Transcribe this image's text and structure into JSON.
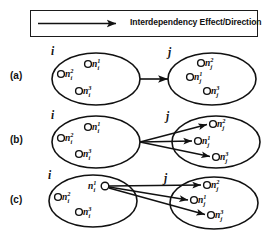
{
  "figure": {
    "background_color": "#ffffff",
    "ink_color": "#111111",
    "legend": {
      "label": "Interdependency Effect/Direction",
      "arrow_icon": "right-arrow-icon"
    },
    "rows": [
      {
        "id": "a",
        "label": "(a)",
        "description": "Whole-set to whole-set interdependency: one arrow from set i to set j",
        "source_set": {
          "label": "i",
          "nodes": [
            {
              "name": "n",
              "superscript": "2",
              "subscript": "i",
              "circle_side": "left"
            },
            {
              "name": "n",
              "superscript": "1",
              "subscript": "i",
              "circle_side": "left"
            },
            {
              "name": "n",
              "superscript": "3",
              "subscript": "i",
              "circle_side": "left"
            }
          ]
        },
        "target_set": {
          "label": "j",
          "nodes": [
            {
              "name": "n",
              "superscript": "2",
              "subscript": "j",
              "circle_side": "left"
            },
            {
              "name": "n",
              "superscript": "1",
              "subscript": "j",
              "circle_side": "left"
            },
            {
              "name": "n",
              "superscript": "3",
              "subscript": "j",
              "circle_side": "left"
            }
          ]
        },
        "arrows": 1,
        "arrow_origin": "set-boundary",
        "arrow_target": "set-boundary"
      },
      {
        "id": "b",
        "label": "(b)",
        "description": "Whole-set to individual nodes: three arrows from set i boundary to each node of set j",
        "source_set": {
          "label": "i",
          "nodes": [
            {
              "name": "n",
              "superscript": "2",
              "subscript": "i",
              "circle_side": "left"
            },
            {
              "name": "n",
              "superscript": "1",
              "subscript": "i",
              "circle_side": "left"
            },
            {
              "name": "n",
              "superscript": "3",
              "subscript": "i",
              "circle_side": "left"
            }
          ]
        },
        "target_set": {
          "label": "j",
          "nodes": [
            {
              "name": "n",
              "superscript": "2",
              "subscript": "j",
              "circle_side": "left"
            },
            {
              "name": "n",
              "superscript": "1",
              "subscript": "j",
              "circle_side": "left"
            },
            {
              "name": "n",
              "superscript": "3",
              "subscript": "j",
              "circle_side": "left"
            }
          ]
        },
        "arrows": 3,
        "arrow_origin": "set-boundary",
        "arrow_target": "individual-nodes"
      },
      {
        "id": "c",
        "label": "(c)",
        "description": "Individual node to individual nodes: three arrows from node n^1_i to each node of set j",
        "source_set": {
          "label": "i",
          "nodes": [
            {
              "name": "n",
              "superscript": "2",
              "subscript": "i",
              "circle_side": "left"
            },
            {
              "name": "n",
              "superscript": "1",
              "subscript": "i",
              "circle_side": "right"
            },
            {
              "name": "n",
              "superscript": "3",
              "subscript": "i",
              "circle_side": "left"
            }
          ]
        },
        "target_set": {
          "label": "j",
          "nodes": [
            {
              "name": "n",
              "superscript": "2",
              "subscript": "j",
              "circle_side": "left"
            },
            {
              "name": "n",
              "superscript": "1",
              "subscript": "j",
              "circle_side": "left"
            },
            {
              "name": "n",
              "superscript": "3",
              "subscript": "j",
              "circle_side": "left"
            }
          ]
        },
        "arrows": 3,
        "arrow_origin": "node-n1-i",
        "arrow_target": "individual-nodes"
      }
    ],
    "row_a": {
      "label": "(a)",
      "source_label": "i",
      "target_label": "j",
      "src_n2": "n",
      "src_n2_sup": "2",
      "src_n2_sub": "i",
      "src_n1": "n",
      "src_n1_sup": "1",
      "src_n1_sub": "i",
      "src_n3": "n",
      "src_n3_sup": "3",
      "src_n3_sub": "i",
      "tgt_n2": "n",
      "tgt_n2_sup": "2",
      "tgt_n2_sub": "j",
      "tgt_n1": "n",
      "tgt_n1_sup": "1",
      "tgt_n1_sub": "j",
      "tgt_n3": "n",
      "tgt_n3_sup": "3",
      "tgt_n3_sub": "j"
    },
    "row_b": {
      "label": "(b)",
      "source_label": "i",
      "target_label": "j",
      "src_n2": "n",
      "src_n2_sup": "2",
      "src_n2_sub": "i",
      "src_n1": "n",
      "src_n1_sup": "1",
      "src_n1_sub": "i",
      "src_n3": "n",
      "src_n3_sup": "3",
      "src_n3_sub": "i",
      "tgt_n2": "n",
      "tgt_n2_sup": "2",
      "tgt_n2_sub": "j",
      "tgt_n1": "n",
      "tgt_n1_sup": "1",
      "tgt_n1_sub": "j",
      "tgt_n3": "n",
      "tgt_n3_sup": "3",
      "tgt_n3_sub": "j"
    },
    "row_c": {
      "label": "(c)",
      "source_label": "i",
      "target_label": "j",
      "src_n2": "n",
      "src_n2_sup": "2",
      "src_n2_sub": "i",
      "src_n1": "n",
      "src_n1_sup": "1",
      "src_n1_sub": "i",
      "src_n3": "n",
      "src_n3_sup": "3",
      "src_n3_sub": "i",
      "tgt_n2": "n",
      "tgt_n2_sup": "2",
      "tgt_n2_sub": "j",
      "tgt_n1": "n",
      "tgt_n1_sup": "1",
      "tgt_n1_sub": "j",
      "tgt_n3": "n",
      "tgt_n3_sup": "3",
      "tgt_n3_sub": "j"
    }
  }
}
